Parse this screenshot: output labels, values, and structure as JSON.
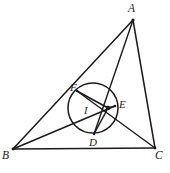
{
  "figure": {
    "kind": "geometry-diagram",
    "background_color": "#ffffff",
    "stroke_color": "#1a1a1a",
    "width": 170,
    "height": 173,
    "points": [
      {
        "id": "A",
        "label": "A",
        "x": 133,
        "y": 20,
        "role": "triangle-vertex"
      },
      {
        "id": "B",
        "label": "B",
        "x": 13,
        "y": 149,
        "role": "triangle-vertex"
      },
      {
        "id": "C",
        "label": "C",
        "x": 155,
        "y": 148,
        "role": "triangle-vertex"
      },
      {
        "id": "D",
        "label": "D",
        "x": 94,
        "y": 134,
        "role": "tangency-point-BC"
      },
      {
        "id": "E",
        "label": "E",
        "x": 115,
        "y": 106,
        "role": "tangency-point-AC"
      },
      {
        "id": "F",
        "label": "F",
        "x": 77,
        "y": 91,
        "role": "tangency-point-AB"
      },
      {
        "id": "I",
        "label": "I",
        "x": 95,
        "y": 108,
        "role": "incenter-label-anchor"
      }
    ],
    "incenter": {
      "x": 108,
      "y": 108
    },
    "incircle": {
      "cx": 93,
      "cy": 108,
      "r": 25
    },
    "segments": [
      {
        "id": "AB",
        "from": "A",
        "to": "B",
        "kind": "side"
      },
      {
        "id": "BC",
        "from": "B",
        "to": "C",
        "kind": "side"
      },
      {
        "id": "CA",
        "from": "C",
        "to": "A",
        "kind": "side"
      },
      {
        "id": "AD",
        "from": "A",
        "to": "D",
        "kind": "cevian"
      },
      {
        "id": "BE",
        "from": "B",
        "to": "E",
        "kind": "cevian"
      },
      {
        "id": "CF",
        "from": "C",
        "to": "F",
        "kind": "cevian"
      },
      {
        "id": "ID",
        "from": "I",
        "to": "D",
        "kind": "radius"
      },
      {
        "id": "IE",
        "from": "I",
        "to": "E",
        "kind": "radius"
      },
      {
        "id": "IF",
        "from": "I",
        "to": "F",
        "kind": "radius"
      }
    ]
  }
}
